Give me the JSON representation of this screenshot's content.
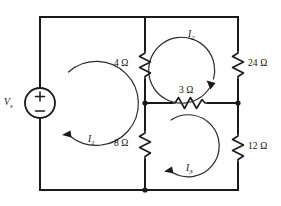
{
  "figure": {
    "type": "electrical-circuit-schematic"
  },
  "source": {
    "name": "voltage-source",
    "label": "V",
    "label_subscript": "s",
    "plus_sign": "+",
    "minus_sign": "−",
    "polarity": "plus-on-top"
  },
  "resistors": [
    {
      "id": "r4",
      "value": "4",
      "unit": "Ω",
      "label": "4 Ω",
      "orientation": "vertical",
      "position": "middle-branch-upper"
    },
    {
      "id": "r24",
      "value": "24",
      "unit": "Ω",
      "label": "24 Ω",
      "orientation": "vertical",
      "position": "right-rail-upper"
    },
    {
      "id": "r3",
      "value": "3",
      "unit": "Ω",
      "label": "3 Ω",
      "orientation": "horizontal",
      "position": "middle-horizontal-branch"
    },
    {
      "id": "r8",
      "value": "8",
      "unit": "Ω",
      "label": "8 Ω",
      "orientation": "vertical",
      "position": "middle-branch-lower"
    },
    {
      "id": "r12",
      "value": "12",
      "unit": "Ω",
      "label": "12 Ω",
      "orientation": "vertical",
      "position": "right-rail-lower"
    }
  ],
  "mesh_currents": [
    {
      "id": "i1",
      "label": "I",
      "subscript": "1",
      "direction": "clockwise",
      "mesh": "left"
    },
    {
      "id": "i2",
      "label": "I",
      "subscript": "2",
      "direction": "clockwise",
      "mesh": "top-right"
    },
    {
      "id": "i3",
      "label": "I",
      "subscript": "3",
      "direction": "clockwise",
      "mesh": "bottom-right"
    }
  ],
  "colors": {
    "wire": "#1a1a1a",
    "background": "#ffffff",
    "text": "#111111"
  }
}
